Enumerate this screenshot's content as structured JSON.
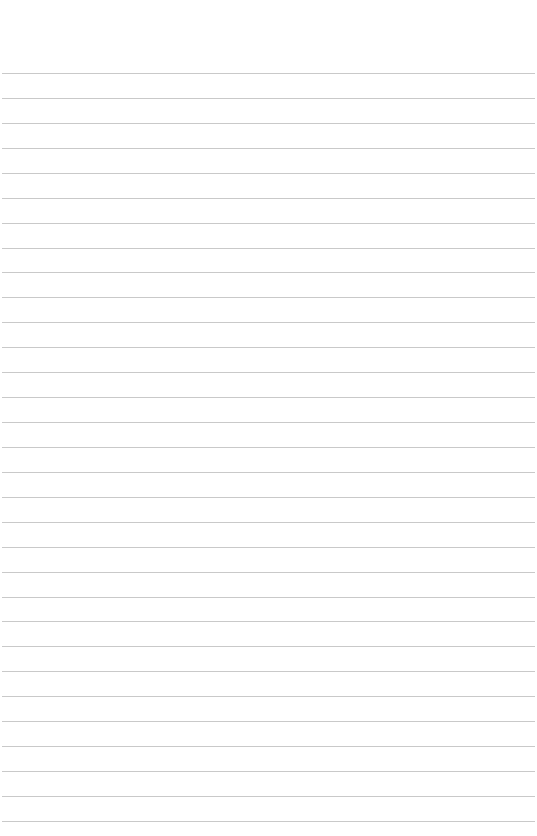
{
  "page": {
    "type": "lined-paper",
    "background": "#ffffff",
    "rule_color": "#c9c9c9",
    "first_rule_y": 73,
    "rule_spacing": 24.93,
    "rule_count": 31,
    "text": ""
  }
}
